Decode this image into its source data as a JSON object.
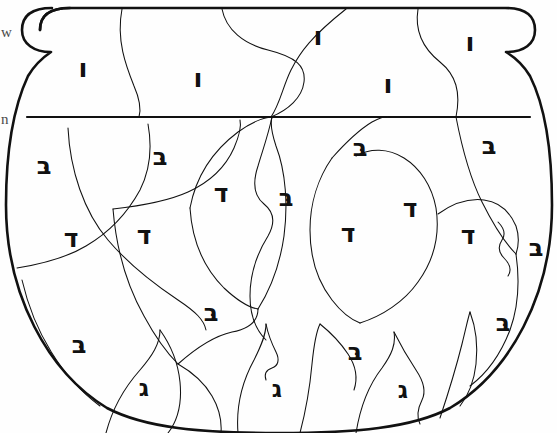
{
  "page": {
    "background_color": "#ffffff",
    "ink_color": "#111111",
    "width": 557,
    "height": 433
  },
  "margin_notes": [
    {
      "name": "left-margin-fragment-top",
      "text": "w",
      "x": 1,
      "y": 24
    },
    {
      "name": "left-margin-fragment-lower",
      "text": "n",
      "x": 1,
      "y": 111
    }
  ],
  "letters": [
    {
      "id": "vav-1",
      "glyph": "ו",
      "x": 83,
      "y": 68,
      "size": 26,
      "rotate": 0
    },
    {
      "id": "vav-2",
      "glyph": "ו",
      "x": 198,
      "y": 78,
      "size": 26,
      "rotate": 0
    },
    {
      "id": "vav-3",
      "glyph": "ו",
      "x": 318,
      "y": 36,
      "size": 26,
      "rotate": 0
    },
    {
      "id": "vav-4",
      "glyph": "ו",
      "x": 388,
      "y": 84,
      "size": 26,
      "rotate": 0
    },
    {
      "id": "vav-5",
      "glyph": "ו",
      "x": 470,
      "y": 42,
      "size": 26,
      "rotate": 0
    },
    {
      "id": "bet-1",
      "glyph": "ּב",
      "x": 44,
      "y": 166,
      "size": 24,
      "rotate": 0
    },
    {
      "id": "bet-2",
      "glyph": "ּב",
      "x": 160,
      "y": 157,
      "size": 24,
      "rotate": 0
    },
    {
      "id": "bet-3",
      "glyph": "ּב",
      "x": 286,
      "y": 198,
      "size": 24,
      "rotate": 0
    },
    {
      "id": "bet-4",
      "glyph": "ּב",
      "x": 360,
      "y": 148,
      "size": 24,
      "rotate": 0
    },
    {
      "id": "bet-5",
      "glyph": "ּב",
      "x": 489,
      "y": 146,
      "size": 24,
      "rotate": 0
    },
    {
      "id": "bet-6",
      "glyph": "ּב",
      "x": 536,
      "y": 248,
      "size": 24,
      "rotate": 0
    },
    {
      "id": "bet-7",
      "glyph": "ּב",
      "x": 211,
      "y": 313,
      "size": 24,
      "rotate": 0
    },
    {
      "id": "bet-8",
      "glyph": "ּב",
      "x": 79,
      "y": 345,
      "size": 24,
      "rotate": 0
    },
    {
      "id": "bet-9",
      "glyph": "ּב",
      "x": 355,
      "y": 352,
      "size": 24,
      "rotate": 0
    },
    {
      "id": "bet-10",
      "glyph": "ּב",
      "x": 503,
      "y": 323,
      "size": 24,
      "rotate": 0
    },
    {
      "id": "dalet-1",
      "glyph": "ד",
      "x": 71,
      "y": 238,
      "size": 25,
      "rotate": 0
    },
    {
      "id": "dalet-2",
      "glyph": "ד",
      "x": 144,
      "y": 235,
      "size": 25,
      "rotate": 0
    },
    {
      "id": "dalet-3",
      "glyph": "ד",
      "x": 221,
      "y": 193,
      "size": 25,
      "rotate": 0
    },
    {
      "id": "dalet-4",
      "glyph": "ד",
      "x": 348,
      "y": 233,
      "size": 25,
      "rotate": 0
    },
    {
      "id": "dalet-5",
      "glyph": "ד",
      "x": 410,
      "y": 208,
      "size": 25,
      "rotate": 0
    },
    {
      "id": "dalet-6",
      "glyph": "ד",
      "x": 468,
      "y": 235,
      "size": 25,
      "rotate": 0
    },
    {
      "id": "gimel-1",
      "glyph": "ג",
      "x": 144,
      "y": 388,
      "size": 23,
      "rotate": 0
    },
    {
      "id": "gimel-2",
      "glyph": "ג",
      "x": 277,
      "y": 389,
      "size": 23,
      "rotate": 0
    },
    {
      "id": "gimel-3",
      "glyph": "ג",
      "x": 403,
      "y": 390,
      "size": 23,
      "rotate": 0
    }
  ],
  "legend_counts": {
    "vav": 5,
    "bet": 10,
    "dalet": 6,
    "gimel": 3
  }
}
